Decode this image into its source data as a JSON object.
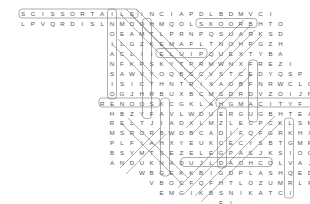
{
  "puzzle": {
    "type": "word-search",
    "pitch_x": 9.9,
    "pitch_y": 9.95,
    "origin_x": 23,
    "origin_y": 9,
    "rows": [
      {
        "start": 0,
        "letters": "SCISSORTAILSINCIAPDLBDMVCI"
      },
      {
        "start": 0,
        "letters": "LPVQRDISLNMDOHMQOLSKOORBHTO"
      },
      {
        "start": 9,
        "letters": "OEAMTLPRNPQSUARKSD"
      },
      {
        "start": 9,
        "letters": "ILGZKEMAFLTNOHPGZH"
      },
      {
        "start": 9,
        "letters": "ACLIIELUIPQUEXTYBA"
      },
      {
        "start": 9,
        "letters": "NFKPSKYTPRMWNXFREZI"
      },
      {
        "start": 9,
        "letters": "SAWVYOQBSCVSTCEDYQSP"
      },
      {
        "start": 9,
        "letters": "ISICTHNTRIXAOBFNRWCLGO"
      },
      {
        "start": 9,
        "letters": "OGJHRBUXBCMSDRDVZOIJN"
      },
      {
        "start": 8,
        "letters": "RENOOSKCGKLAHGMACITYF"
      },
      {
        "start": 9,
        "letters": "HBZYFAVLWDUERGUGBHTEA"
      },
      {
        "start": 9,
        "letters": "RELTJIADXLMZLECPCKLSM"
      },
      {
        "start": 9,
        "letters": "MSRORBWDBCADIFQFGRKHXAFOH"
      },
      {
        "start": 9,
        "letters": "PLFIAHXYEUKCECYSBTGMRKL"
      },
      {
        "start": 9,
        "letters": "BSYMTSEZELEGPASJKSIOC"
      },
      {
        "start": 9,
        "letters": "ANDUKNADUJLDAOHCOLVAJ"
      },
      {
        "start": 12,
        "letters": "WBGEKKBIGDPLASHQEDM"
      },
      {
        "start": 13,
        "letters": "VBOCFQFHTLOZUMRLP"
      },
      {
        "start": 14,
        "letters": "EMGIKBSNIKATCI"
      },
      {
        "start": 20,
        "letters": "FI"
      }
    ],
    "found_words": [
      {
        "word": "SCISSORTAILS",
        "dir": "horizontal",
        "row": 0,
        "col": 0,
        "len": 12
      },
      {
        "word": "SKOORB",
        "dir": "horizontal",
        "row": 1,
        "col": 18,
        "len": 6
      },
      {
        "word": "ELUIP",
        "dir": "horizontal",
        "row": 4,
        "col": 14,
        "len": 5
      },
      {
        "word": "RENOOS",
        "dir": "horizontal",
        "row": 9,
        "col": 8,
        "len": 6
      },
      {
        "word": "LAHGMACITY",
        "dir": "horizontal",
        "row": 9,
        "col": 19,
        "len": 10
      },
      {
        "word": "BIGDPLASH",
        "dir": "horizontal",
        "row": 16,
        "col": 18,
        "len": 9
      },
      {
        "word": "NORMAN",
        "dir": "vertical",
        "row": 1,
        "col": 9,
        "len": 9
      },
      {
        "word": "TULSA",
        "dir": "vertical",
        "row": 9,
        "col": 14,
        "len": 8
      },
      {
        "word": "LITTLE",
        "dir": "vertical",
        "row": 7,
        "col": 28,
        "len": 8
      },
      {
        "word": "RIVER",
        "dir": "vertical",
        "row": 8,
        "col": 21,
        "len": 10
      }
    ]
  }
}
